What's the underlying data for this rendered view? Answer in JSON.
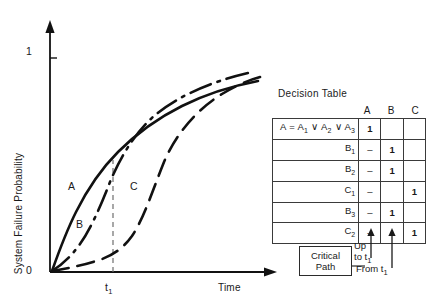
{
  "chart_data": {
    "type": "line",
    "title": "",
    "xlabel": "Time",
    "ylabel": "System Failure Probability",
    "xlim": [
      0,
      1
    ],
    "ylim": [
      0,
      1.1
    ],
    "grid": false,
    "legend": "inline-labels",
    "y_ticks": [
      "0",
      "1"
    ],
    "x_ticks": [
      "t1"
    ],
    "x_tick_display": [
      "t",
      "1"
    ],
    "annotations": [
      {
        "text": "t1",
        "type": "vertical-dashed-line",
        "x": 0.33
      }
    ],
    "series": [
      {
        "name": "A",
        "style": "solid",
        "label": "A",
        "x": [
          0.0,
          0.04,
          0.09,
          0.15,
          0.22,
          0.3,
          0.4,
          0.5,
          0.62,
          0.75,
          0.88,
          1.0
        ],
        "y": [
          0.0,
          0.11,
          0.24,
          0.37,
          0.49,
          0.6,
          0.7,
          0.77,
          0.83,
          0.87,
          0.9,
          0.92
        ]
      },
      {
        "name": "B",
        "style": "dash-dot",
        "label": "B",
        "x": [
          0.0,
          0.05,
          0.11,
          0.18,
          0.26,
          0.33,
          0.42,
          0.52,
          0.64,
          0.78,
          0.92,
          1.0
        ],
        "y": [
          0.0,
          0.03,
          0.09,
          0.19,
          0.34,
          0.53,
          0.68,
          0.78,
          0.86,
          0.92,
          0.96,
          0.98
        ]
      },
      {
        "name": "C",
        "style": "dashed",
        "label": "C",
        "x": [
          0.0,
          0.07,
          0.15,
          0.23,
          0.3,
          0.38,
          0.46,
          0.55,
          0.65,
          0.78,
          0.9,
          1.0
        ],
        "y": [
          0.0,
          0.02,
          0.05,
          0.09,
          0.15,
          0.3,
          0.52,
          0.7,
          0.82,
          0.9,
          0.94,
          0.96
        ]
      }
    ]
  },
  "decision_table": {
    "title": "Decision Table",
    "columns": [
      "A",
      "B",
      "C"
    ],
    "rows": [
      {
        "condition_html": "A = A<sub class=\"sub\">1</sub> &or; A<sub class=\"sub\">2</sub> &or; A<sub class=\"sub\">3</sub>",
        "condition_text": "A = A1 ∨ A2 ∨ A3",
        "A": "1",
        "B": "",
        "C": ""
      },
      {
        "condition_html": "B<sub class=\"sub\">1</sub>",
        "condition_text": "B1",
        "A": "–",
        "B": "1",
        "C": ""
      },
      {
        "condition_html": "B<sub class=\"sub\">2</sub>",
        "condition_text": "B2",
        "A": "–",
        "B": "1",
        "C": ""
      },
      {
        "condition_html": "C<sub class=\"sub\">1</sub>",
        "condition_text": "C1",
        "A": "–",
        "B": "",
        "C": "1"
      },
      {
        "condition_html": "B<sub class=\"sub\">3</sub>",
        "condition_text": "B3",
        "A": "–",
        "B": "1",
        "C": ""
      },
      {
        "condition_html": "C<sub class=\"sub\">2</sub>",
        "condition_text": "C2",
        "A": "–",
        "B": "",
        "C": "1"
      }
    ]
  },
  "critical_path": {
    "line1": "Critical",
    "line2": "Path",
    "annotation_up": "Up",
    "annotation_to_t1_html": "to t<sub class=\"sub\">1</sub>",
    "annotation_to_t1_text": "to t1",
    "annotation_from_t1_html": "From t<sub class=\"sub\">1</sub>",
    "annotation_from_t1_text": "From t1"
  },
  "colors": {
    "ink": "#1a1a1a",
    "line": "#111111",
    "table_border": "#3a3a3a",
    "dashed_guide": "#6e6e6e",
    "background": "#ffffff"
  }
}
